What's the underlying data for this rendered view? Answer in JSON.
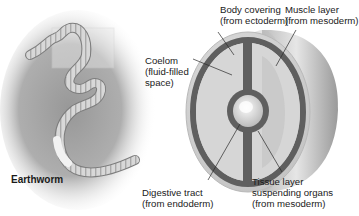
{
  "figure": {
    "specimen_label": "Earthworm",
    "labels": {
      "body_covering": {
        "line1": "Body covering",
        "line2": "(from ectoderm)"
      },
      "muscle_layer": {
        "line1": "Muscle layer",
        "line2": "(from mesoderm)"
      },
      "coelom": {
        "line1": "Coelom",
        "line2": "(fluid-filled",
        "line3": "space)"
      },
      "digestive_tract": {
        "line1": "Digestive tract",
        "line2": "(from endoderm)"
      },
      "tissue_layer": {
        "line1": "Tissue layer",
        "line2": "suspending organs",
        "line3": "(from mesoderm)"
      }
    },
    "colors": {
      "mesoderm_band": "#5f5f5f",
      "body_light": "#d9d9d9",
      "body_shadow": "#a8a8a8",
      "soil": "#8a8a8a",
      "text": "#1a1a1a"
    }
  }
}
